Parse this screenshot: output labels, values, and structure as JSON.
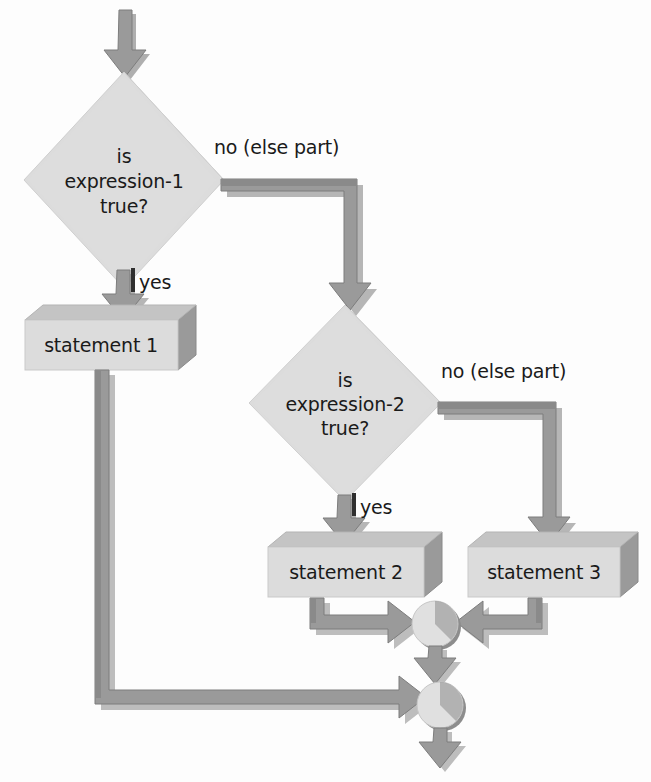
{
  "diagram": {
    "type": "flowchart",
    "colors": {
      "background": "#fdfdfd",
      "shape_fill": "#dcdcdc",
      "shape_fill_light": "#e3e3e3",
      "shadow": "#919191",
      "arrow_body": "#9a9a9a",
      "arrow_edge": "#6f6f6f",
      "text": "#1a1a1a"
    },
    "decisions": [
      {
        "id": "decision-1",
        "line1": "is",
        "line2": "expression-1",
        "line3": "true?",
        "yes_label": "yes",
        "no_label": "no (else part)"
      },
      {
        "id": "decision-2",
        "line1": "is",
        "line2": "expression-2",
        "line3": "true?",
        "yes_label": "yes",
        "no_label": "no (else part)"
      }
    ],
    "processes": [
      {
        "id": "statement-1",
        "label": "statement 1"
      },
      {
        "id": "statement-2",
        "label": "statement 2"
      },
      {
        "id": "statement-3",
        "label": "statement 3"
      }
    ],
    "connectors": [
      {
        "id": "merge-inner",
        "label": ""
      },
      {
        "id": "merge-outer",
        "label": ""
      }
    ]
  }
}
